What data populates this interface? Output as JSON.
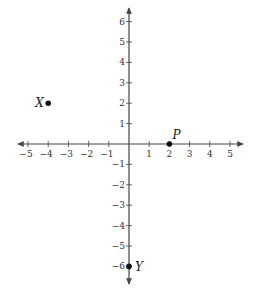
{
  "diagram": {
    "type": "coordinate-plane",
    "x_axis": {
      "min": -5,
      "max": 5,
      "tick_labels": [
        "-5",
        "-4",
        "-3",
        "-2",
        "-1",
        "1",
        "2",
        "3",
        "4",
        "5"
      ]
    },
    "y_axis": {
      "min": -6,
      "max": 6,
      "tick_labels": [
        "6",
        "5",
        "4",
        "3",
        "2",
        "1",
        "-1",
        "-2",
        "-3",
        "-4",
        "-5",
        "-6"
      ]
    },
    "points": [
      {
        "label": "X",
        "x": -4,
        "y": 2
      },
      {
        "label": "P",
        "x": 2,
        "y": 0
      },
      {
        "label": "Y",
        "x": 0,
        "y": -6
      }
    ],
    "colors": {
      "axis": "#444444",
      "point": "#111111",
      "text": "#333333"
    }
  }
}
